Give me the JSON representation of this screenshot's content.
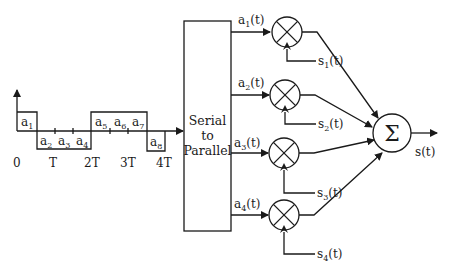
{
  "waveform": {
    "symbols": [
      {
        "name": "a",
        "sub": "1"
      },
      {
        "name": "a",
        "sub": "2"
      },
      {
        "name": "a",
        "sub": "3"
      },
      {
        "name": "a",
        "sub": "4"
      },
      {
        "name": "a",
        "sub": "5"
      },
      {
        "name": "a",
        "sub": "6"
      },
      {
        "name": "a",
        "sub": "7"
      },
      {
        "name": "a",
        "sub": "8"
      }
    ],
    "time_ticks": [
      "0",
      "T",
      "2T",
      "3T",
      "4T"
    ]
  },
  "converter": {
    "line1": "Serial",
    "line2": "to",
    "line3": "Parallel"
  },
  "branches": [
    {
      "input": {
        "name": "a",
        "sub": "1",
        "suffix": "(t)"
      },
      "carrier": {
        "name": "s",
        "sub": "1",
        "suffix": "(t)"
      }
    },
    {
      "input": {
        "name": "a",
        "sub": "2",
        "suffix": "(t)"
      },
      "carrier": {
        "name": "s",
        "sub": "2",
        "suffix": "(t)"
      }
    },
    {
      "input": {
        "name": "a",
        "sub": "3",
        "suffix": "(t)"
      },
      "carrier": {
        "name": "s",
        "sub": "3",
        "suffix": "(t)"
      }
    },
    {
      "input": {
        "name": "a",
        "sub": "4",
        "suffix": "(t)"
      },
      "carrier": {
        "name": "s",
        "sub": "4",
        "suffix": "(t)"
      }
    }
  ],
  "summer": {
    "symbol": "Σ",
    "output": "s(t)"
  }
}
